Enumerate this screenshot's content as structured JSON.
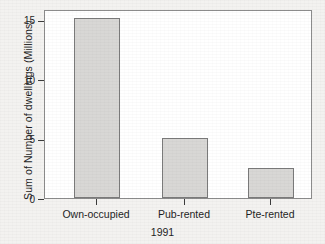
{
  "chart_data": {
    "type": "bar",
    "title": "",
    "xlabel": "1991",
    "ylabel": "Sum of Number of dwellings (Millions)",
    "categories": [
      "Own-occupied",
      "Pub-rented",
      "Pte-rented"
    ],
    "values": [
      15.2,
      5.05,
      2.55
    ],
    "ylim": [
      0,
      16
    ],
    "yticks": [
      0,
      5,
      10,
      15
    ],
    "ytick_labels": [
      "0",
      "5",
      "10",
      "15"
    ],
    "grid": false,
    "legend": null,
    "bar_fill_color": "#d8d7d5",
    "bar_edge_color": "#7a7a7a",
    "plot_background": "#ffffff",
    "figure_background": "#f3f2f0",
    "axis_color": "#8c8c8c"
  }
}
